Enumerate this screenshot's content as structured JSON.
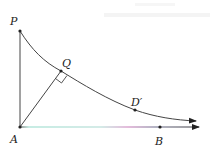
{
  "diagram": {
    "type": "geometry",
    "colors": {
      "line": "#333333",
      "curve": "#333333",
      "ray_gradient": [
        "#7fd6c4",
        "#c86fb8",
        "#333333"
      ]
    },
    "points": {
      "P": {
        "label": "P",
        "x": 20,
        "y": 31
      },
      "A": {
        "label": "A",
        "x": 20,
        "y": 127
      },
      "Q": {
        "label": "Q",
        "x": 61,
        "y": 71
      },
      "D": {
        "label": "D′",
        "x": 135,
        "y": 110
      },
      "B": {
        "label": "B",
        "x": 160,
        "y": 127
      }
    },
    "segments": [
      {
        "from": "A",
        "to": "P"
      },
      {
        "from": "A",
        "to": "Q"
      },
      {
        "from": "A",
        "to": "B",
        "ray": true
      }
    ],
    "annotations": {
      "right_angle_at": "Q"
    }
  }
}
